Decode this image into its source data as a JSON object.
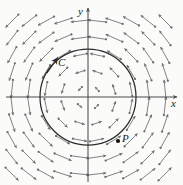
{
  "figure": {
    "width": 183,
    "height": 185,
    "background_color": "#fbfbfa",
    "arrow_color": "#6b6b70",
    "axis_color": "#4a4a4a",
    "curve_color": "#2b2b2b",
    "point_color": "#111111"
  },
  "labels": {
    "x_axis": "x",
    "y_axis": "y",
    "curve": "C",
    "point": "P"
  },
  "axes": {
    "origin_x": 88,
    "origin_y": 97,
    "x_axis_start": 6,
    "x_axis_end": 177,
    "y_axis_start": 8,
    "y_axis_end": 182
  },
  "curve": {
    "name": "C",
    "shape": "circle",
    "center_x": 88,
    "center_y": 97,
    "radius": 48,
    "orientation": "counterclockwise",
    "arrowhead_x": 53,
    "arrowhead_y": 63
  },
  "point": {
    "name": "P",
    "x": 118,
    "y": 141,
    "radius": 2.1
  },
  "chart_data": {
    "type": "quiver",
    "xlabel": "x",
    "ylabel": "y",
    "grid": false,
    "legend": null,
    "field_description": "Counterclockwise rotational vector field; arrow length grows with distance from origin",
    "origin_px": [
      88,
      97
    ],
    "grid_spacing_px": 17,
    "arrow_scale_px": 7.6,
    "grid_columns": 10,
    "grid_rows": 10,
    "col_x_px": [
      12,
      29,
      46,
      63,
      80,
      97,
      114,
      131,
      148,
      165
    ],
    "row_y_px": [
      21,
      38,
      55,
      72,
      89,
      106,
      123,
      140,
      157,
      174
    ],
    "annotations": [
      {
        "text": "C",
        "x": 58,
        "y": 57
      },
      {
        "text": "P",
        "x": 122,
        "y": 133
      }
    ]
  }
}
